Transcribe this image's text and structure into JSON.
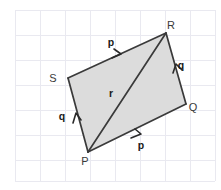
{
  "figure": {
    "canvas": {
      "width": 221,
      "height": 190
    },
    "colors": {
      "background": "#ffffff",
      "grid": "#e9e9f0",
      "fill": "#dcdcdc",
      "stroke": "#3a3a3a",
      "label": "#1a1a1a"
    },
    "grid": {
      "spacing": 25,
      "x_lines": [
        15,
        40,
        65,
        90,
        115,
        140,
        165,
        190,
        215
      ],
      "y_lines": [
        10,
        35,
        60,
        85,
        110,
        135,
        160,
        181
      ],
      "visible": true
    },
    "vertices": [
      {
        "name": "P",
        "label": "P",
        "x": 88,
        "y": 152,
        "label_x": 85,
        "label_y": 165
      },
      {
        "name": "Q",
        "label": "Q",
        "x": 186,
        "y": 104,
        "label_x": 193,
        "label_y": 111
      },
      {
        "name": "R",
        "label": "R",
        "x": 166,
        "y": 33,
        "label_x": 171,
        "label_y": 29
      },
      {
        "name": "S",
        "label": "S",
        "x": 68,
        "y": 78,
        "label_x": 53,
        "label_y": 82
      }
    ],
    "polygon_points": "88,152 186,104 166,33 68,78",
    "edges": [
      {
        "name": "edge-SR",
        "from": "S",
        "to": "R",
        "d": "M 68 78 L 166 33"
      },
      {
        "name": "edge-RQ",
        "from": "R",
        "to": "Q",
        "d": "M 166 33 L 186 104"
      },
      {
        "name": "edge-QP",
        "from": "Q",
        "to": "P",
        "d": "M 186 104 L 88 152"
      },
      {
        "name": "edge-PS",
        "from": "P",
        "to": "S",
        "d": "M 88 152 L 68 78"
      }
    ],
    "diagonal": {
      "name": "diagonal-PR",
      "from": "P",
      "to": "R",
      "d": "M 88 152 L 166 33"
    },
    "vector_labels": [
      {
        "name": "vector-p-top",
        "text": "p",
        "x": 111,
        "y": 46
      },
      {
        "name": "vector-q-right",
        "text": "q",
        "x": 181,
        "y": 69
      },
      {
        "name": "vector-r-middle",
        "text": "r",
        "x": 111,
        "y": 97
      },
      {
        "name": "vector-q-left",
        "text": "q",
        "x": 62,
        "y": 120
      },
      {
        "name": "vector-p-bottom",
        "text": "p",
        "x": 141,
        "y": 149
      }
    ],
    "arrow_heads": [
      {
        "name": "arrow-p-top",
        "d": "M 112 58 L 121 54 L 114 49"
      },
      {
        "name": "arrow-q-right",
        "d": "M 173 73 L 176 64 L 182 70"
      },
      {
        "name": "arrow-q-left",
        "d": "M 73 123 L 76 113 L 81 120"
      },
      {
        "name": "arrow-p-bottom",
        "d": "M 131 138 L 141 134 L 135 129"
      }
    ]
  }
}
